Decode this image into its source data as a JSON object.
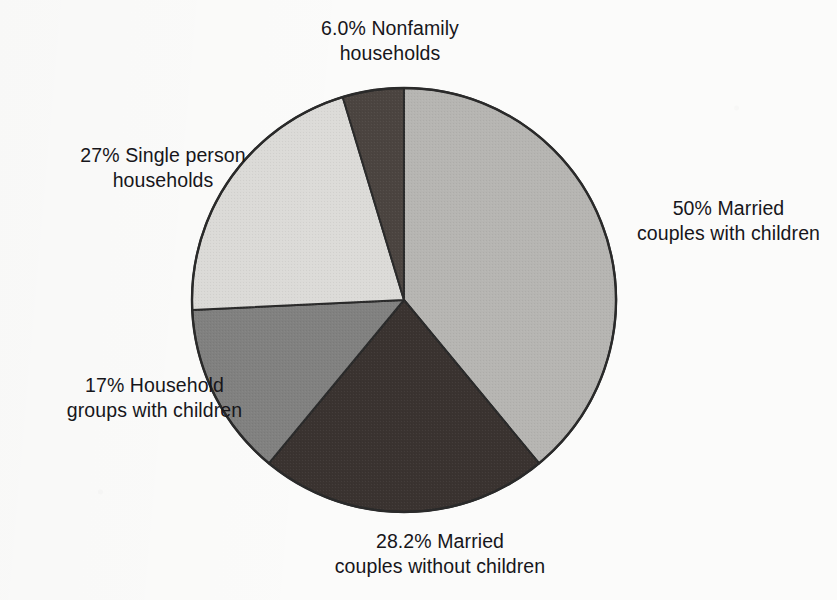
{
  "figure": {
    "background_color": "#fbfbfa",
    "text_color": "#17161a",
    "outline_color": "#2a2a2a"
  },
  "chart_data": {
    "type": "pie",
    "title": "",
    "subtitle": "",
    "xlabel": "",
    "ylabel": "",
    "legend_position": "none",
    "grid": false,
    "labels_placement": "outside-callout-free",
    "note": "Printed percentages sum to 128.2%; drawn wedge angles are normalized to 360 degrees.",
    "center": {
      "x": 404,
      "y": 300
    },
    "radius": 212,
    "start_angle_deg": 0,
    "direction": "clockwise",
    "categories": [
      "Married couples with children",
      "Married couples without children",
      "Household groups with children",
      "Single person households",
      "Nonfamily households"
    ],
    "values": [
      50,
      28.2,
      17,
      27,
      6.0
    ],
    "value_labels": [
      "50%",
      "28.2%",
      "17%",
      "27%",
      "6.0%"
    ],
    "colors": [
      "#b6b5b2",
      "#3a3330",
      "#818180",
      "#dcdbd8",
      "#4b4440"
    ],
    "slices": [
      {
        "name": "Married couples with children",
        "value": 50,
        "value_label": "50%",
        "color": "#b6b5b2",
        "start_deg": 0,
        "end_deg": 140.4,
        "sweep_deg": 140.4
      },
      {
        "name": "Married couples without children",
        "value": 28.2,
        "value_label": "28.2%",
        "color": "#3a3330",
        "start_deg": 140.4,
        "end_deg": 219.6,
        "sweep_deg": 79.2
      },
      {
        "name": "Household groups with children",
        "value": 17,
        "value_label": "17%",
        "color": "#818180",
        "start_deg": 219.6,
        "end_deg": 267.3,
        "sweep_deg": 47.7
      },
      {
        "name": "Single person households",
        "value": 27,
        "value_label": "27%",
        "color": "#dcdbd8",
        "start_deg": 267.3,
        "end_deg": 343.2,
        "sweep_deg": 75.8
      },
      {
        "name": "Nonfamily households",
        "value": 6.0,
        "value_label": "6.0%",
        "color": "#4b4440",
        "start_deg": 343.2,
        "end_deg": 360,
        "sweep_deg": 16.8
      }
    ]
  },
  "labels": {
    "nonfamily": {
      "line1": "6.0% Nonfamily",
      "line2": "households"
    },
    "single_person": {
      "line1": "27% Single person",
      "line2": "households"
    },
    "household_groups": {
      "line1": "17% Household",
      "line2": "groups with children"
    },
    "married_without": {
      "line1": "28.2% Married",
      "line2": "couples without children"
    },
    "married_with": {
      "line1": "50% Married",
      "line2": "couples with children"
    }
  }
}
